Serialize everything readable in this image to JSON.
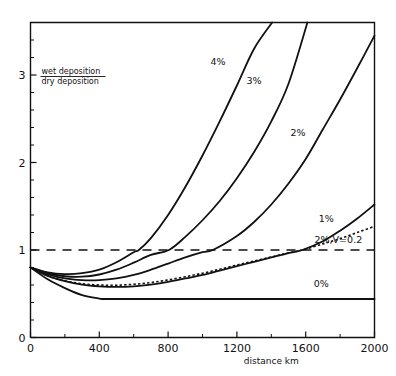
{
  "chart_data": {
    "type": "line",
    "title": "",
    "xlabel": "distance  km",
    "ylabel": "wet deposition / dry deposition",
    "ylabel_numerator": "wet deposition",
    "ylabel_denominator": "dry deposition",
    "xlim": [
      0,
      2000
    ],
    "ylim": [
      0,
      3.6
    ],
    "grid": false,
    "legend_position": "inline-curve-labels",
    "x_ticks_major": [
      0,
      400,
      800,
      1200,
      1600,
      2000
    ],
    "x_tick_labels": [
      "0",
      "400",
      "800",
      "1200",
      "1600",
      "2000"
    ],
    "x_ticks_minor": [
      200,
      600,
      1000,
      1400,
      1800
    ],
    "y_ticks_major": [
      0,
      1,
      2,
      3
    ],
    "y_tick_labels": [
      "0",
      "1",
      "2",
      "3"
    ],
    "y_ticks_minor": [
      0.2,
      0.4,
      0.6,
      0.8,
      1.2,
      1.4,
      1.6,
      1.8,
      2.2,
      2.4,
      2.6,
      2.8,
      3.2,
      3.4
    ],
    "reference_line": {
      "name": "unity-ratio-line",
      "axis": "y",
      "value": 1,
      "style": "dashed",
      "label": ""
    },
    "common_origin": {
      "x": 0,
      "y": 0.8
    },
    "series": [
      {
        "name": "4%",
        "label": "4%",
        "style": "solid",
        "label_x": 1090,
        "label_y": 3.12,
        "x": [
          0,
          100,
          200,
          300,
          400,
          500,
          600,
          630,
          700,
          800,
          900,
          1000,
          1100,
          1200,
          1300,
          1405
        ],
        "y": [
          0.8,
          0.745,
          0.725,
          0.735,
          0.775,
          0.86,
          0.975,
          1.0,
          1.135,
          1.4,
          1.72,
          2.08,
          2.47,
          2.88,
          3.3,
          3.6
        ]
      },
      {
        "name": "3%",
        "label": "3%",
        "style": "solid",
        "label_x": 1300,
        "label_y": 2.9,
        "x": [
          0,
          100,
          200,
          300,
          400,
          500,
          600,
          700,
          805,
          900,
          1000,
          1100,
          1200,
          1300,
          1400,
          1500,
          1610
        ],
        "y": [
          0.8,
          0.735,
          0.7,
          0.695,
          0.72,
          0.775,
          0.855,
          0.945,
          1.0,
          1.15,
          1.34,
          1.56,
          1.82,
          2.12,
          2.47,
          2.9,
          3.6
        ]
      },
      {
        "name": "2%",
        "label": "2%",
        "style": "solid",
        "label_x": 1555,
        "label_y": 2.3,
        "x": [
          0,
          100,
          200,
          300,
          400,
          500,
          600,
          700,
          800,
          900,
          1000,
          1060,
          1200,
          1300,
          1400,
          1500,
          1600,
          1700,
          1800,
          1900,
          2000
        ],
        "y": [
          0.8,
          0.725,
          0.675,
          0.655,
          0.655,
          0.675,
          0.715,
          0.775,
          0.845,
          0.915,
          0.975,
          1.0,
          1.16,
          1.32,
          1.52,
          1.76,
          2.04,
          2.38,
          2.72,
          3.08,
          3.45
        ]
      },
      {
        "name": "1%",
        "label": "1%",
        "style": "solid",
        "label_x": 1720,
        "label_y": 1.32,
        "x": [
          0,
          100,
          200,
          300,
          400,
          500,
          600,
          700,
          800,
          900,
          1000,
          1100,
          1200,
          1300,
          1400,
          1500,
          1580,
          1700,
          1800,
          1900,
          2000
        ],
        "y": [
          0.8,
          0.705,
          0.645,
          0.605,
          0.585,
          0.578,
          0.585,
          0.605,
          0.635,
          0.675,
          0.715,
          0.765,
          0.815,
          0.865,
          0.915,
          0.965,
          1.0,
          1.1,
          1.22,
          1.36,
          1.52
        ]
      },
      {
        "name": "2%,V=0.2",
        "label": "2%,V=0.2",
        "style": "dotted",
        "label_x": 1790,
        "label_y": 1.08,
        "x": [
          0,
          100,
          200,
          300,
          400,
          500,
          600,
          700,
          800,
          900,
          1000,
          1100,
          1200,
          1300,
          1400,
          1500,
          1580,
          1700,
          1800,
          1900,
          2000
        ],
        "y": [
          0.8,
          0.705,
          0.648,
          0.615,
          0.6,
          0.598,
          0.608,
          0.628,
          0.658,
          0.695,
          0.735,
          0.78,
          0.828,
          0.875,
          0.92,
          0.968,
          1.0,
          1.07,
          1.13,
          1.2,
          1.27
        ]
      },
      {
        "name": "0%",
        "label": "0%",
        "style": "solid",
        "label_x": 1690,
        "label_y": 0.58,
        "x": [
          0,
          100,
          200,
          300,
          400,
          430,
          600,
          800,
          1000,
          1200,
          1400,
          1600,
          1800,
          2000
        ],
        "y": [
          0.8,
          0.665,
          0.565,
          0.485,
          0.445,
          0.44,
          0.44,
          0.44,
          0.44,
          0.44,
          0.44,
          0.44,
          0.44,
          0.44
        ]
      }
    ]
  },
  "colors": {
    "ink": "#111111",
    "background": "#ffffff"
  }
}
